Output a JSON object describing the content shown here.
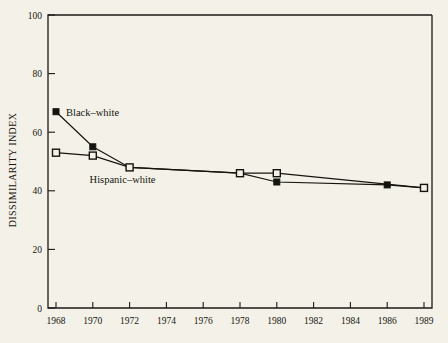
{
  "chart_data": {
    "type": "line",
    "title": "",
    "xlabel": "",
    "ylabel": "DISSIMILARITY INDEX",
    "xlim": [
      1968,
      1989
    ],
    "ylim": [
      0,
      100
    ],
    "grid": false,
    "legend_position": "inline-annotations",
    "x_tick_labels": [
      "1968",
      "1970",
      "1972",
      "1974",
      "1976",
      "1978",
      "1980",
      "1982",
      "1984",
      "1986",
      "1989"
    ],
    "x_tick_values": [
      1968,
      1970,
      1972,
      1974,
      1976,
      1978,
      1980,
      1982,
      1984,
      1986,
      1989
    ],
    "y_tick_labels": [
      "0",
      "20",
      "40",
      "60",
      "80",
      "100"
    ],
    "y_tick_values": [
      0,
      20,
      40,
      60,
      80,
      100
    ],
    "series": [
      {
        "name": "Black-white",
        "marker": "filled-square",
        "x": [
          1968,
          1970,
          1972,
          1978,
          1980,
          1986,
          1989
        ],
        "values": [
          67,
          55,
          48,
          46,
          43,
          42,
          41
        ]
      },
      {
        "name": "Hispanic-white",
        "marker": "open-square",
        "x": [
          1968,
          1970,
          1972,
          1978,
          1980,
          1989
        ],
        "values": [
          53,
          52,
          48,
          46,
          46,
          41
        ]
      }
    ],
    "annotations": [
      {
        "text": "Black–white",
        "x": 1968,
        "y": 67
      },
      {
        "text": "Hispanic–white",
        "x": 1972,
        "y": 44
      }
    ],
    "colors": {
      "background": "#f4f2e8",
      "axis": "#15140f",
      "series_black_white": "#15140f",
      "series_hispanic_white": "#15140f"
    }
  }
}
